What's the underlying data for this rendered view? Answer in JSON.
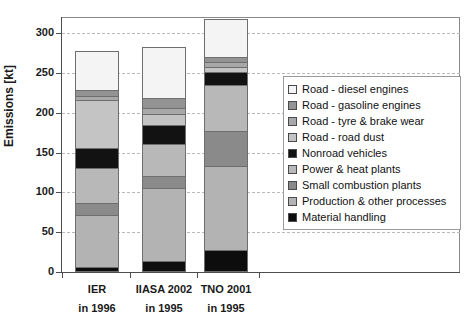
{
  "chart_data": {
    "type": "bar",
    "subtype": "stacked-vertical",
    "title": "",
    "xlabel": "",
    "ylabel": "Emissions [kt]",
    "ylim": [
      0,
      325
    ],
    "yticks": [
      0,
      50,
      100,
      150,
      200,
      250,
      300
    ],
    "ytick_labels": [
      "0",
      "50",
      "100",
      "150",
      "200",
      "250",
      "300"
    ],
    "grid": true,
    "grid_axis": "y",
    "legend_position": "right",
    "categories": [
      "IER",
      "IIASA 2002",
      "TNO 2001"
    ],
    "category_sublabels": [
      "in 1996",
      "in 1995",
      "in 1995"
    ],
    "series": [
      {
        "name": "Material handling",
        "color": "#0d0d0d",
        "values": [
          6,
          14,
          27
        ]
      },
      {
        "name": "Production & other processes",
        "color": "#b3b3b3",
        "values": [
          66,
          91,
          106
        ]
      },
      {
        "name": "Small combustion plants",
        "color": "#8a8a8a",
        "values": [
          14,
          15,
          44
        ]
      },
      {
        "name": "Power & heat plants",
        "color": "#b8b8b8",
        "values": [
          44,
          40,
          58
        ]
      },
      {
        "name": "Nonroad vehicles",
        "color": "#121212",
        "values": [
          26,
          25,
          16
        ]
      },
      {
        "name": "Road - road dust",
        "color": "#c4c4c4",
        "values": [
          60,
          13,
          6
        ]
      },
      {
        "name": "Road - tyre & brake wear",
        "color": "#a8a8a8",
        "values": [
          5,
          8,
          7
        ]
      },
      {
        "name": "Road - gasoline engines",
        "color": "#939393",
        "values": [
          8,
          12,
          6
        ]
      },
      {
        "name": "Road - diesel engines",
        "color": "#f4f4f4",
        "values": [
          49,
          64,
          47
        ]
      }
    ],
    "totals": [
      278,
      282,
      317
    ],
    "legend_entries": [
      {
        "label": "Road - diesel engines",
        "color": "#f4f4f4"
      },
      {
        "label": "Road - gasoline engines",
        "color": "#939393"
      },
      {
        "label": "Road - tyre & brake wear",
        "color": "#a8a8a8"
      },
      {
        "label": "Road - road dust",
        "color": "#c4c4c4"
      },
      {
        "label": "Nonroad vehicles",
        "color": "#121212"
      },
      {
        "label": "Power & heat plants",
        "color": "#b8b8b8"
      },
      {
        "label": "Small combustion plants",
        "color": "#8a8a8a"
      },
      {
        "label": "Production & other processes",
        "color": "#b3b3b3"
      },
      {
        "label": "Material handling",
        "color": "#0d0d0d"
      }
    ]
  }
}
